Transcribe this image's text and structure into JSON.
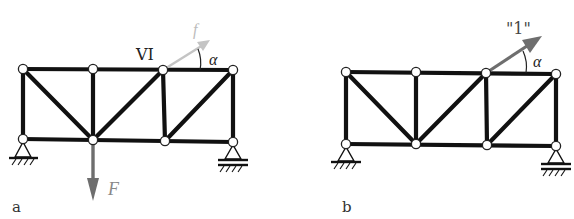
{
  "figure": {
    "width": 574,
    "height": 219,
    "colors": {
      "member": "#111111",
      "node_fill": "#ffffff",
      "force_arrow": "#6e6e6e",
      "light_arrow": "#c4c4c4",
      "unit_arrow": "#6e6e6e",
      "label": "#222222",
      "force_label": "#888888",
      "light_label": "#bcbcbc"
    }
  },
  "panels": [
    {
      "id": "a",
      "label": "a",
      "top_nodes": [
        [
          23,
          69
        ],
        [
          93,
          69
        ],
        [
          163,
          70
        ],
        [
          233,
          70
        ]
      ],
      "bottom_nodes": [
        [
          23,
          139
        ],
        [
          93,
          140
        ],
        [
          165,
          141
        ],
        [
          233,
          142
        ]
      ],
      "node_label": "VI",
      "angle_label": "α",
      "inclined_arrow_label": "f",
      "load_label": "F",
      "supports": {
        "left": "pin",
        "right": "roller"
      }
    },
    {
      "id": "b",
      "label": "b",
      "top_nodes": [
        [
          346,
          72
        ],
        [
          416,
          72
        ],
        [
          486,
          73
        ],
        [
          556,
          74
        ]
      ],
      "bottom_nodes": [
        [
          346,
          144
        ],
        [
          416,
          144
        ],
        [
          487,
          145
        ],
        [
          556,
          146
        ]
      ],
      "unit_load_label": "\"1\"",
      "angle_label": "α",
      "supports": {
        "left": "pin",
        "right": "roller"
      }
    }
  ]
}
